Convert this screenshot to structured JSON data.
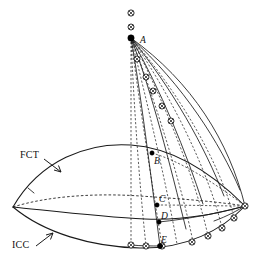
{
  "figure": {
    "width": 262,
    "height": 265,
    "background_color": "#ffffff",
    "line_color": "#1a1a1a"
  },
  "annotations": {
    "curve_labels": [
      {
        "id": "fct",
        "text": "FCT",
        "x": 18,
        "y": 156,
        "arrow_from": [
          44,
          158
        ],
        "arrow_to": [
          62,
          172
        ]
      },
      {
        "id": "icc",
        "text": "ICC",
        "x": 12,
        "y": 246,
        "arrow_from": [
          36,
          245
        ],
        "arrow_to": [
          54,
          232
        ]
      }
    ],
    "point_labels": [
      {
        "id": "A",
        "text": "A",
        "x": 141,
        "y": 43
      },
      {
        "id": "B",
        "text": "B",
        "x": 156,
        "y": 163
      },
      {
        "id": "C",
        "text": "C",
        "x": 161,
        "y": 201
      },
      {
        "id": "D",
        "text": "D",
        "x": 163,
        "y": 216
      },
      {
        "id": "E",
        "text": "E",
        "x": 163,
        "y": 241
      }
    ]
  },
  "geometry": {
    "apex": {
      "x": 131,
      "y": 38
    },
    "left_vertex": {
      "x": 13,
      "y": 207
    },
    "right_vertex": {
      "x": 245,
      "y": 206
    },
    "curves": {
      "fct_top_ridge": "M 13 207 C 40 160 88 142 131 145 C 175 148 215 176 245 206",
      "fct_hidden_dashed": "M 13 207 C 48 196 96 193 140 196 C 185 199 220 202 245 206",
      "mid_curve": "M 13 207 C 52 211 100 217 145 219 C 188 221 222 212 245 206",
      "icc_bottom": "M 13 207 C 44 233 92 247 140 248 C 186 249 222 230 245 206",
      "right_small_1": "M 245 206 C 238 210 228 216 214 221",
      "right_small_2": "M 245 206 C 240 212 233 219 224 226"
    },
    "apex_arc_markers": [
      {
        "x": 131,
        "y": 13
      },
      {
        "x": 131,
        "y": 26
      },
      {
        "x": 136,
        "y": 58
      },
      {
        "x": 145,
        "y": 76
      },
      {
        "x": 152,
        "y": 90
      },
      {
        "x": 161,
        "y": 105
      },
      {
        "x": 170,
        "y": 120
      }
    ],
    "bottom_arc_markers": [
      {
        "x": 131,
        "y": 245
      },
      {
        "x": 146,
        "y": 246
      },
      {
        "x": 162,
        "y": 246
      },
      {
        "x": 192,
        "y": 242
      },
      {
        "x": 208,
        "y": 236
      },
      {
        "x": 222,
        "y": 228
      },
      {
        "x": 234,
        "y": 218
      },
      {
        "x": 245,
        "y": 206
      }
    ],
    "solid_points": [
      {
        "id": "A",
        "x": 131,
        "y": 38,
        "r": 3.0
      },
      {
        "id": "B",
        "x": 152,
        "y": 153,
        "r": 2.2
      },
      {
        "id": "C",
        "x": 157,
        "y": 205,
        "r": 2.2
      },
      {
        "id": "D",
        "x": 159,
        "y": 222,
        "r": 2.2
      },
      {
        "id": "E",
        "x": 160,
        "y": 246,
        "r": 2.6
      }
    ],
    "dashed_rays_from_apex": [
      "M 131 38 L 131 245",
      "M 131 38 C 134 110 140 190 146 246",
      "M 131 38 C 140 110 154 195 162 246",
      "M 131 38 C 148 105 168 190 177 244",
      "M 131 38 C 155 100 182 186 193 242",
      "M 131 38 C 163 98 196 180 208 236",
      "M 131 38 C 171 95 209 172 222 228",
      "M 131 38 C 179 92 221 165 234 218"
    ],
    "solid_rays_from_apex": [
      "M 131 38 C 141 95 150 170 160 246",
      "M 131 38 C 152 92 170 165 186 228",
      "M 131 38 C 161 90 186 150 200 200",
      "M 131 38 C 172 88 205 145 222 190",
      "M 131 38 C 183 85 218 140 238 185",
      "M 131 38 C 192 82 228 140 245 206"
    ],
    "cross_lines": [
      "M 146 246 C 160 242 176 236 190 228",
      "M 131 245 L 160 246",
      "M 152 153 C 180 160 210 180 245 206",
      "M 157 205 C 185 205 218 206 245 206",
      "M 159 222 C 188 219 220 213 245 206"
    ]
  },
  "markers": {
    "ring_radius": 3.1,
    "ring_fill": "#ffffff",
    "cross_style": "x-inside-circle",
    "solid_fill": "#000000"
  }
}
